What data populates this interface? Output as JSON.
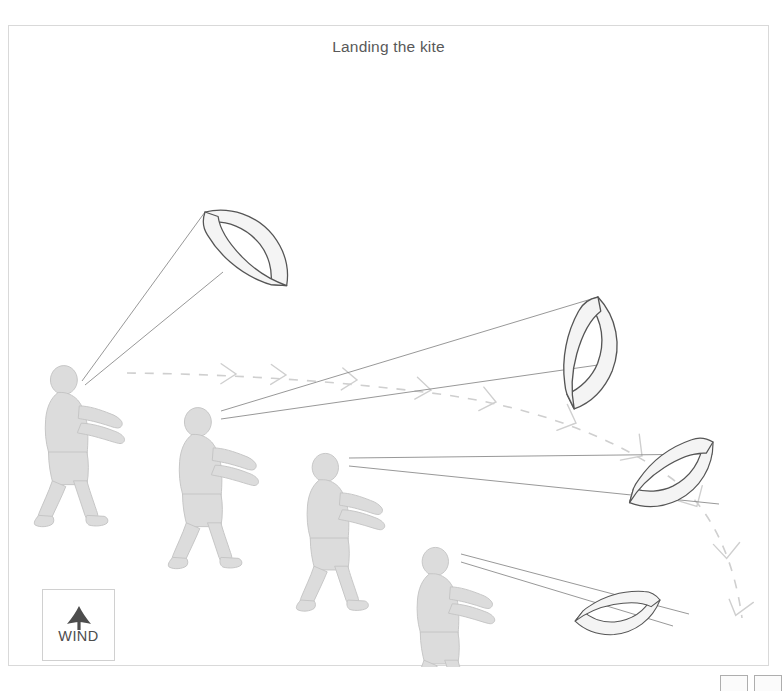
{
  "figure": {
    "title": "Landing the kite",
    "border_color": "#d9d9d9",
    "background": "#ffffff"
  },
  "wind_indicator": {
    "label": "WIND",
    "icon": "wind-up-arrow-icon",
    "arrow_color": "#4d4d4d",
    "direction": "up"
  },
  "pager": {
    "buttons": [
      "",
      ""
    ]
  },
  "diagram_data": {
    "type": "diagram",
    "title": "Landing the kite",
    "description": "Four-stage sequence showing a kiteboarder walking downwind while steering the kite from high in the window down to the ground for landing.",
    "colors": {
      "kite_fill": "#f2f2f2",
      "kite_stroke": "#555555",
      "person_fill": "#d9d9d9",
      "person_stroke": "#bdbdbd",
      "line_stroke": "#808080",
      "path_stroke": "#cccccc",
      "frame_stroke": "#d9d9d9",
      "text": "#595959"
    },
    "stages": [
      {
        "index": 1,
        "person": {
          "x": 52,
          "y": 340,
          "facing": "right"
        },
        "kite": {
          "x": 205,
          "y": 210,
          "rotation": -30,
          "position": "high overhead, upwind"
        },
        "lines": 2
      },
      {
        "index": 2,
        "person": {
          "x": 190,
          "y": 390,
          "facing": "right"
        },
        "kite": {
          "x": 600,
          "y": 305,
          "rotation": 35,
          "position": "steered down to one side"
        },
        "lines": 2
      },
      {
        "index": 3,
        "person": {
          "x": 318,
          "y": 455,
          "facing": "right"
        },
        "kite": {
          "x": 718,
          "y": 460,
          "rotation": 80,
          "position": "low at edge of window"
        },
        "lines": 2
      },
      {
        "index": 4,
        "person": {
          "x": 428,
          "y": 550,
          "facing": "right"
        },
        "kite": {
          "x": 680,
          "y": 605,
          "rotation": 100,
          "position": "landed flat on the ground"
        },
        "lines": 2
      }
    ],
    "trajectory": {
      "style": "dashed with chevron arrowheads",
      "label": "kite flight path",
      "points": [
        [
          118,
          347
        ],
        [
          250,
          352
        ],
        [
          360,
          358
        ],
        [
          430,
          366
        ],
        [
          500,
          378
        ],
        [
          560,
          392
        ],
        [
          615,
          415
        ],
        [
          660,
          443
        ],
        [
          700,
          480
        ],
        [
          722,
          520
        ],
        [
          731,
          560
        ],
        [
          733,
          588
        ]
      ]
    }
  }
}
